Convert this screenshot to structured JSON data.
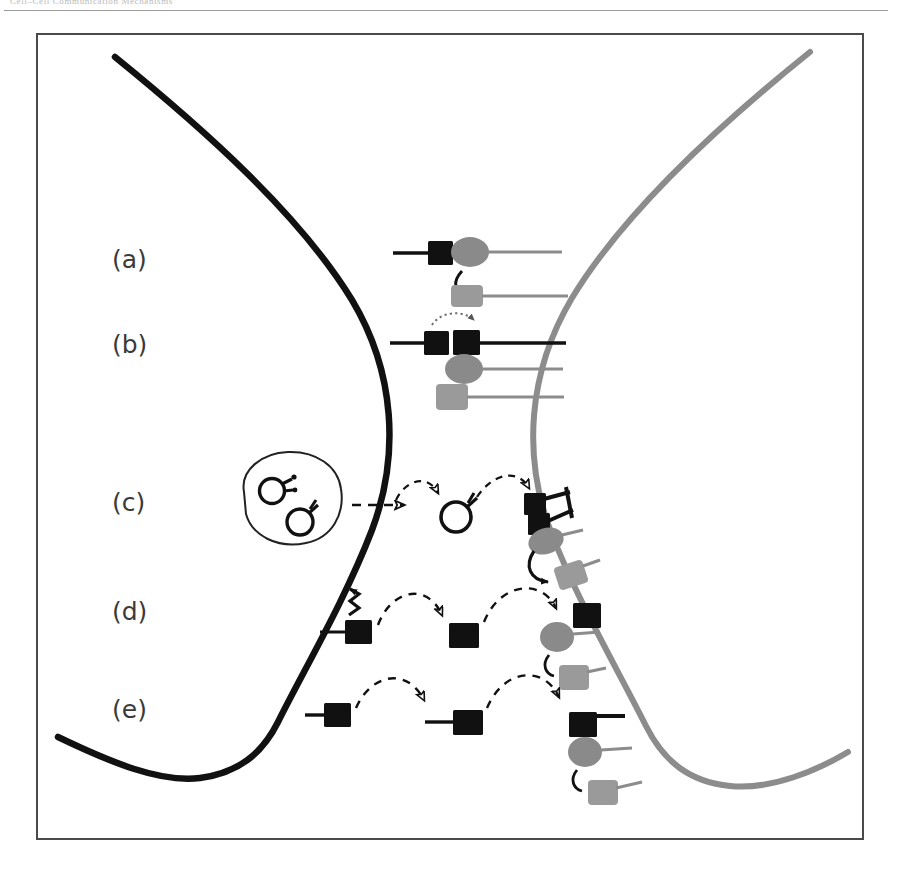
{
  "page": {
    "header_text": "Cell–Cell Communication Mechanisms",
    "figure_caption_labels": [
      "(a)",
      "(b)",
      "(c)",
      "(d)",
      "(e)"
    ]
  },
  "colors": {
    "signaling_cell_membrane": "#111111",
    "receiving_cell_membrane": "#8c8c8c",
    "ligand_fill": "#111111",
    "receptor_fill": "#8a8a8a",
    "effector_fill": "#9a9a9a",
    "frame_stroke": "#4a4a4a",
    "label_text": "#3a3a3a",
    "arrow_stroke": "#111111"
  },
  "rows": [
    {
      "id": "row-a",
      "label": "(a)",
      "mechanism": "juxtacrine-direct-contact",
      "description": "Membrane-bound ligand on the signaling cell binds a receptor on the apposed receiving cell",
      "elements": [
        "membrane-bound-ligand",
        "receptor-ellipse",
        "intracellular-effector",
        "signal-transduction-arrow"
      ]
    },
    {
      "id": "row-b",
      "label": "(b)",
      "mechanism": "ligand-transfer-trans-endocytosis",
      "description": "Ligand is transferred laterally between membranes before receptor engagement",
      "elements": [
        "ligand-pair",
        "dotted-transfer-arrow",
        "receptor-ellipse",
        "intracellular-effector",
        "signal-transduction-arrow"
      ]
    },
    {
      "id": "row-c",
      "label": "(c)",
      "mechanism": "exosome-vesicle-mediated",
      "description": "Multivesicular body releases ligand-bearing vesicles that travel to and engage receptors",
      "elements": [
        "multivesicular-body",
        "cargo-vesicle",
        "dashed-transport-arrow",
        "free-vesicle",
        "bound-vesicle-ligands",
        "receptor-ellipse",
        "intracellular-effector",
        "signal-transduction-arrow"
      ]
    },
    {
      "id": "row-d",
      "label": "(d)",
      "mechanism": "proteolytic-shedding-paracrine",
      "description": "Protease cleavage releases the tethered ligand which diffuses to receptors on the receiving cell",
      "elements": [
        "tethered-ligand",
        "cleavage-zigzag",
        "dashed-diffusion-arrow",
        "free-ligand",
        "receptor-ellipse",
        "intracellular-effector",
        "signal-transduction-arrow"
      ]
    },
    {
      "id": "row-e",
      "label": "(e)",
      "mechanism": "secreted-ligand-diffusion",
      "description": "Secreted ligand on a stalk diffuses across the gap and binds receptors on the receiving cell",
      "elements": [
        "tethered-ligand",
        "dashed-diffusion-arrow",
        "free-ligand",
        "receptor-ellipse",
        "intracellular-effector",
        "signal-transduction-arrow"
      ]
    }
  ],
  "legend_semantics": {
    "black_square": "ligand",
    "gray_ellipse": "receptor",
    "gray_rounded_square": "downstream effector",
    "open_circle_with_stub": "vesicle carrying ligand",
    "dashed_arc_arrow": "diffusion / transport",
    "dotted_arc_arrow": "lateral transfer",
    "zigzag": "proteolytic cleavage",
    "curved_solid_arrow": "intracellular signal transduction"
  }
}
